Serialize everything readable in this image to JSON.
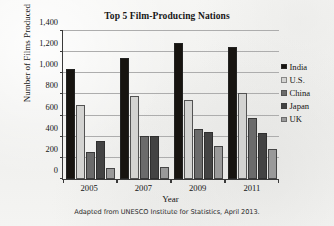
{
  "chart_data": {
    "type": "bar",
    "title": "Top 5 Film-Producing Nations",
    "xlabel": "Year",
    "ylabel": "Number of Films Produced",
    "categories": [
      "2005",
      "2007",
      "2009",
      "2011"
    ],
    "series": [
      {
        "name": "India",
        "color": "#171410",
        "values": [
          1040,
          1145,
          1290,
          1250
        ]
      },
      {
        "name": "U.S.",
        "color": "#d3d3d1",
        "values": [
          700,
          785,
          745,
          810
        ]
      },
      {
        "name": "China",
        "color": "#6b6b6b",
        "values": [
          255,
          410,
          475,
          580
        ]
      },
      {
        "name": "Japan",
        "color": "#434343",
        "values": [
          355,
          405,
          448,
          435
        ]
      },
      {
        "name": "UK",
        "color": "#9a9a9a",
        "values": [
          100,
          115,
          310,
          285
        ]
      }
    ],
    "ylim": [
      0,
      1400
    ],
    "yticks": [
      0,
      200,
      400,
      600,
      800,
      1000,
      1200,
      1400
    ],
    "ytick_labels": [
      "0",
      "200",
      "400",
      "600",
      "800",
      "1,000",
      "1,200",
      "1,400"
    ],
    "grid": true,
    "legend_position": "right",
    "caption": "Adapted from UNESCO Institute for Statistics, April 2013."
  }
}
